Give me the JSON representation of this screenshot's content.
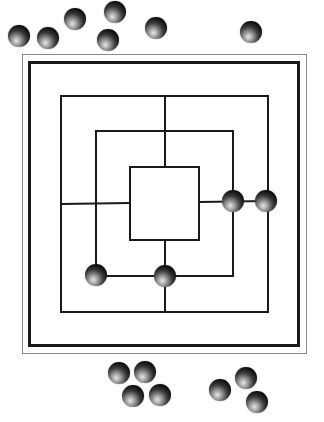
{
  "game": {
    "name": "Nine Men's Morris",
    "colors": {
      "line": "#1a1a1a",
      "piece": "#0a0a0a",
      "board_bg": "#ffffff"
    }
  },
  "board": {
    "squares": [
      {
        "name": "outer",
        "x1": 61,
        "y1": 96,
        "x2": 268,
        "y2": 312
      },
      {
        "name": "middle",
        "x1": 96,
        "y1": 131,
        "x2": 233,
        "y2": 276
      },
      {
        "name": "inner",
        "x1": 130,
        "y1": 167,
        "x2": 199,
        "y2": 240
      }
    ],
    "placed_pieces": [
      {
        "id": "board-piece-1",
        "x": 233,
        "y": 201
      },
      {
        "id": "board-piece-2",
        "x": 266,
        "y": 201
      },
      {
        "id": "board-piece-3",
        "x": 96,
        "y": 275
      },
      {
        "id": "board-piece-4",
        "x": 165,
        "y": 276
      }
    ]
  },
  "reserve_top": [
    {
      "x": 19,
      "y": 36
    },
    {
      "x": 48,
      "y": 38
    },
    {
      "x": 75,
      "y": 19
    },
    {
      "x": 115,
      "y": 12
    },
    {
      "x": 108,
      "y": 40
    },
    {
      "x": 156,
      "y": 28
    },
    {
      "x": 251,
      "y": 32
    }
  ],
  "reserve_bottom": [
    {
      "x": 119,
      "y": 373
    },
    {
      "x": 145,
      "y": 372
    },
    {
      "x": 133,
      "y": 396
    },
    {
      "x": 160,
      "y": 395
    },
    {
      "x": 220,
      "y": 390
    },
    {
      "x": 246,
      "y": 378
    },
    {
      "x": 257,
      "y": 402
    }
  ]
}
